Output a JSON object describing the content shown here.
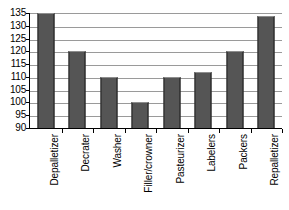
{
  "chart_data": {
    "type": "bar",
    "title": "",
    "subtitle": "",
    "xlabel": "",
    "ylabel": "",
    "ylim": [
      90,
      135
    ],
    "yticks": [
      90,
      95,
      100,
      105,
      110,
      115,
      120,
      125,
      130,
      135
    ],
    "ytick_labels": [
      "90",
      "95",
      "100",
      "105",
      "110",
      "115",
      "120",
      "125",
      "130",
      "135"
    ],
    "grid": true,
    "legend": false,
    "legend_position": "none",
    "categories": [
      "Depalletizer",
      "Decrater",
      "Washer",
      "Filler/crowner",
      "Pasteurizer",
      "Labelers",
      "Packers",
      "Repalletizer"
    ],
    "values": [
      135,
      120,
      110,
      100,
      110,
      112,
      120,
      134
    ],
    "bar_color": "#555555",
    "gridline_color": "#9a9a9a",
    "axis_color": "#000000",
    "background_color": "#ffffff"
  }
}
